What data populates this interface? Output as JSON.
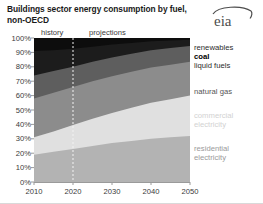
{
  "title": "Buildings sector energy consumption by fuel, non-OECD",
  "branding": {
    "logo_text": "eia",
    "logo_name": "eia-logo"
  },
  "annotations": {
    "history": "history",
    "projections": "projections",
    "divider_year": 2020
  },
  "chart_data": {
    "type": "area",
    "stacked": true,
    "normalized": true,
    "title": "Buildings sector energy consumption by fuel, non-OECD",
    "xlabel": "",
    "ylabel": "",
    "xlim": [
      2010,
      2050
    ],
    "ylim": [
      0,
      100
    ],
    "grid": false,
    "legend_position": "right",
    "x": [
      2010,
      2015,
      2020,
      2025,
      2030,
      2035,
      2040,
      2045,
      2050
    ],
    "xticks": [
      2010,
      2020,
      2030,
      2040,
      2050
    ],
    "xtick_labels": [
      "2010",
      "2020",
      "2030",
      "2040",
      "2050"
    ],
    "yticks": [
      0,
      10,
      20,
      30,
      40,
      50,
      60,
      70,
      80,
      90,
      100
    ],
    "ytick_labels": [
      "0%",
      "10%",
      "20%",
      "30%",
      "40%",
      "50%",
      "60%",
      "70%",
      "80%",
      "90%",
      "100%"
    ],
    "stack_order_bottom_to_top": [
      "residential electricity",
      "commercial electricity",
      "natural gas",
      "liquid fuels",
      "coal",
      "renewables"
    ],
    "series": [
      {
        "name": "residential electricity",
        "color": "#b3b3b3",
        "label_color": "#8c8c8c",
        "label_bold": false,
        "values": [
          19,
          21,
          23,
          25,
          27,
          28.5,
          30,
          31,
          32
        ]
      },
      {
        "name": "commercial electricity",
        "color": "#e0e0e0",
        "label_color": "#d2d2d2",
        "label_bold": false,
        "values": [
          12,
          14,
          16.5,
          19,
          21,
          23,
          25,
          26.5,
          28
        ]
      },
      {
        "name": "natural gas",
        "color": "#8c8c8c",
        "label_color": "#555555",
        "label_bold": false,
        "values": [
          27,
          27,
          26.5,
          26,
          25.5,
          25,
          24.5,
          24,
          23.5
        ]
      },
      {
        "name": "liquid fuels",
        "color": "#5e5e5e",
        "label_color": "#2b2b2b",
        "label_bold": false,
        "values": [
          16,
          15,
          14,
          13.5,
          13,
          12.5,
          12,
          11.5,
          11
        ]
      },
      {
        "name": "coal",
        "color": "#1c1c1c",
        "label_color": "#000000",
        "label_bold": true,
        "values": [
          17,
          14.5,
          12.5,
          10.5,
          9,
          7.5,
          6.2,
          5.3,
          4.3
        ]
      },
      {
        "name": "renewables",
        "color": "#0d0d0d",
        "label_color": "#2b2b2b",
        "label_bold": false,
        "values": [
          9,
          8.5,
          7.5,
          6,
          4.5,
          3.5,
          2.3,
          1.7,
          1.2
        ]
      }
    ],
    "legend_entries": [
      {
        "label": "renewables",
        "color": "#2b2b2b",
        "bold": false,
        "y": 44
      },
      {
        "label": "coal",
        "color": "#000000",
        "bold": true,
        "y": 53
      },
      {
        "label": "liquid fuels",
        "color": "#2b2b2b",
        "bold": false,
        "y": 62
      },
      {
        "label": "natural gas",
        "color": "#555555",
        "bold": false,
        "y": 88
      },
      {
        "label": "commercial\nelectricity",
        "color": "#d2d2d2",
        "bold": false,
        "y": 112
      },
      {
        "label": "residential\nelectricity",
        "color": "#9a9a9a",
        "bold": false,
        "y": 145
      }
    ]
  }
}
